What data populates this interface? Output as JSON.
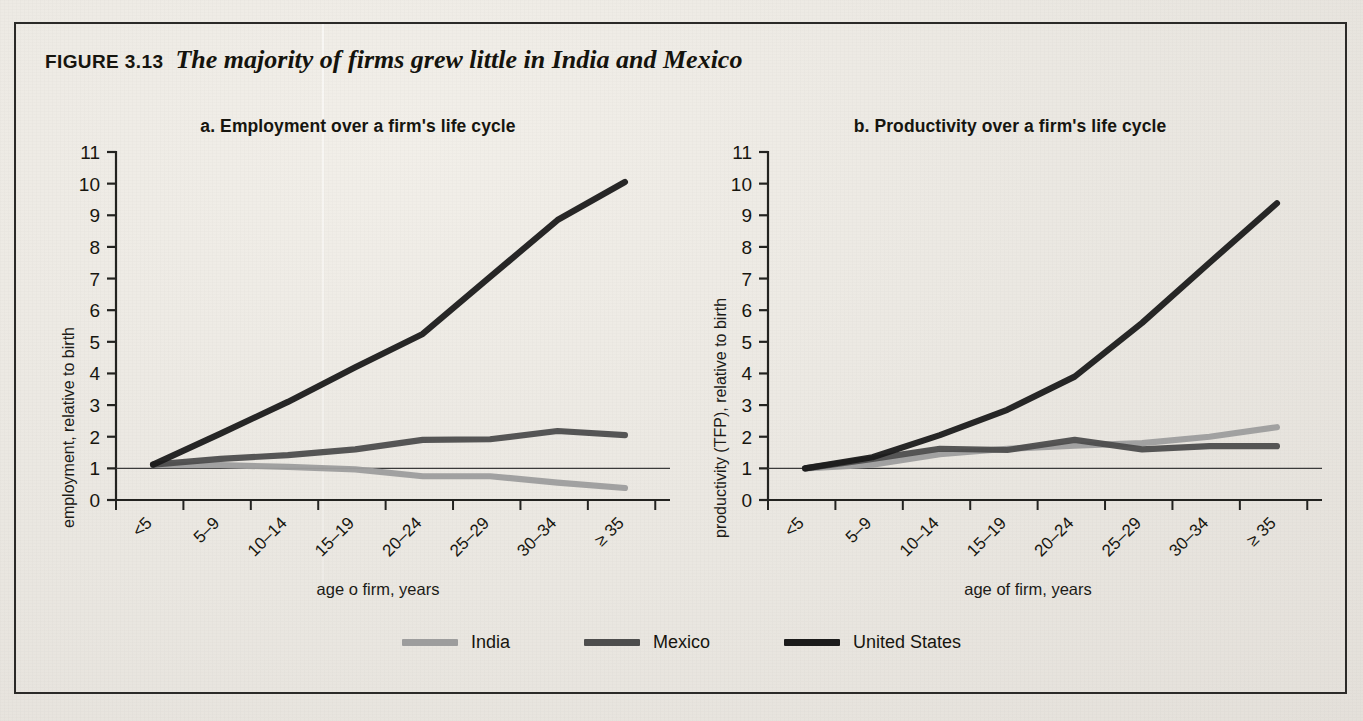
{
  "figure": {
    "label": "FIGURE 3.13",
    "title": "The majority of firms grew little in India and Mexico"
  },
  "panels": [
    {
      "letter": "a.",
      "title": "Employment over a firm's life cycle",
      "ylabel": "employment, relative to birth",
      "xlabel": "age o firm, years"
    },
    {
      "letter": "b.",
      "title": "Productivity over a firm's life cycle",
      "ylabel": "productivity (TFP), relative to birth",
      "xlabel": "age of firm, years"
    }
  ],
  "legend": {
    "position": "bottom-center",
    "items": [
      {
        "label": "India",
        "color": "#9d9d9d"
      },
      {
        "label": "Mexico",
        "color": "#4d4d4d"
      },
      {
        "label": "United States",
        "color": "#1b1b1b"
      }
    ]
  },
  "reference_line": {
    "value": 1,
    "color": "#3a3a3a"
  },
  "chart_data": [
    {
      "type": "line",
      "panel": "a",
      "title": "a. Employment over a firm's life cycle",
      "xlabel": "age o firm, years",
      "ylabel": "employment, relative to birth",
      "categories": [
        "<5",
        "5–9",
        "10–14",
        "15–19",
        "20–24",
        "25–29",
        "30–34",
        "≥ 35"
      ],
      "yticks": [
        0,
        1,
        2,
        3,
        4,
        5,
        6,
        7,
        8,
        9,
        10,
        11
      ],
      "ylim": [
        0,
        11
      ],
      "grid": false,
      "legend": "bottom-center",
      "series": [
        {
          "name": "India",
          "color": "#9d9d9d",
          "values": [
            1.1,
            1.1,
            1.05,
            0.97,
            0.75,
            0.75,
            0.55,
            0.38
          ]
        },
        {
          "name": "Mexico",
          "color": "#4d4d4d",
          "values": [
            1.12,
            1.3,
            1.42,
            1.6,
            1.9,
            1.92,
            2.18,
            2.05
          ]
        },
        {
          "name": "United States",
          "color": "#1b1b1b",
          "values": [
            1.12,
            2.1,
            3.1,
            4.2,
            5.25,
            7.05,
            8.85,
            10.05
          ]
        }
      ]
    },
    {
      "type": "line",
      "panel": "b",
      "title": "b. Productivity over a firm's life cycle",
      "xlabel": "age of firm, years",
      "ylabel": "productivity (TFP), relative to birth",
      "categories": [
        "<5",
        "5–9",
        "10–14",
        "15–19",
        "20–24",
        "25–29",
        "30–34",
        "≥ 35"
      ],
      "yticks": [
        0,
        1,
        2,
        3,
        4,
        5,
        6,
        7,
        8,
        9,
        10,
        11
      ],
      "ylim": [
        0,
        11
      ],
      "grid": false,
      "legend": "bottom-center",
      "series": [
        {
          "name": "India",
          "color": "#9d9d9d",
          "values": [
            1.0,
            1.12,
            1.45,
            1.62,
            1.72,
            1.8,
            2.0,
            2.3
          ]
        },
        {
          "name": "Mexico",
          "color": "#4d4d4d",
          "values": [
            1.0,
            1.3,
            1.62,
            1.58,
            1.9,
            1.6,
            1.7,
            1.7
          ]
        },
        {
          "name": "United States",
          "color": "#1b1b1b",
          "values": [
            1.0,
            1.35,
            2.05,
            2.85,
            3.9,
            5.6,
            7.5,
            9.38
          ]
        }
      ]
    }
  ]
}
